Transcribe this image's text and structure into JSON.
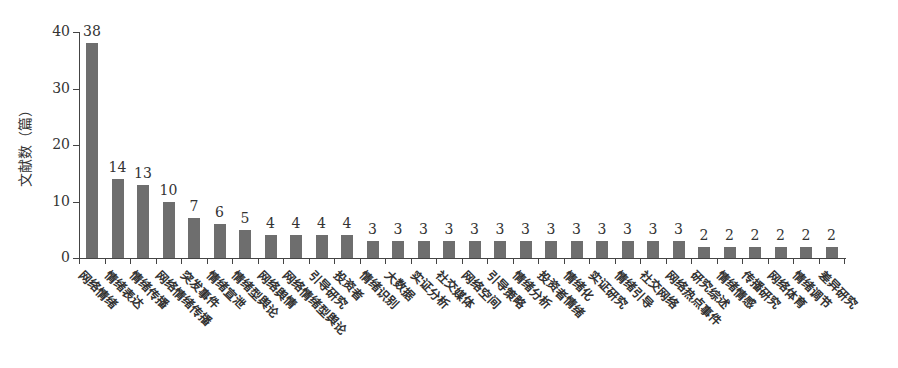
{
  "chart_data": {
    "type": "bar",
    "title": "",
    "xlabel": "",
    "ylabel": "文献数（篇）",
    "ylim": [
      0,
      40
    ],
    "yticks": [
      0,
      10,
      20,
      30,
      40
    ],
    "grid": false,
    "legend": null,
    "bar_color": "#6e6e6e",
    "categories": [
      "网络情绪",
      "情绪表达",
      "情绪传播",
      "网络情绪传播",
      "突发事件",
      "情绪宣泄",
      "情绪型舆论",
      "网络舆情",
      "网络情绪型舆论",
      "引导研究",
      "投资者",
      "情绪识别",
      "大数据",
      "实证分析",
      "社交媒体",
      "网络空间",
      "引导策略",
      "情绪分析",
      "投资者情绪",
      "情绪化",
      "实证研究",
      "情绪引导",
      "社交网络",
      "网络热点事件",
      "研究综述",
      "情绪情感",
      "传播研究",
      "网络体育",
      "情绪调节",
      "差异研究"
    ],
    "values": [
      38,
      14,
      13,
      10,
      7,
      6,
      5,
      4,
      4,
      4,
      4,
      3,
      3,
      3,
      3,
      3,
      3,
      3,
      3,
      3,
      3,
      3,
      3,
      3,
      2,
      2,
      2,
      2,
      2,
      2
    ]
  }
}
